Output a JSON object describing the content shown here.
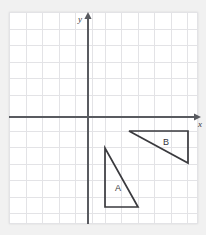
{
  "figure": {
    "kind": "coordinate-grid-geometry-figure",
    "background_color": "#f1f1f1",
    "plot_background_color": "#ffffff",
    "grid_color": "#e3e3e6",
    "axis_color": "#595b60",
    "shape_color": "#3a3a3e",
    "plot_frame": {
      "left": 9,
      "top": 12,
      "width": 189,
      "height": 212
    },
    "grid": {
      "spacing_px": 16.5,
      "show": true,
      "vertical_count": 12,
      "horizontal_count": 13
    },
    "axes": {
      "x_axis": {
        "label": "x",
        "label_x": 198,
        "label_y": 126,
        "y_px": 117,
        "x_start": 9,
        "x_end": 197,
        "arrow": "right"
      },
      "y_axis": {
        "label": "y",
        "label_x": 81,
        "label_y": 22,
        "x_px": 88,
        "y_start": 224,
        "y_end": 15,
        "arrow": "up"
      },
      "origin": {
        "x": 88,
        "y": 117
      }
    },
    "shapes": [
      {
        "name": "triangle-a",
        "label": "A",
        "label_x": 118,
        "label_y": 191,
        "type": "right-triangle",
        "points": "105,148 105,207 138,207",
        "vertices_px": [
          [
            105,
            148
          ],
          [
            105,
            207
          ],
          [
            138,
            207
          ]
        ],
        "vertices_grid": [
          [
            1,
            -2
          ],
          [
            1,
            -5.5
          ],
          [
            3,
            -5.5
          ]
        ]
      },
      {
        "name": "triangle-b",
        "label": "B",
        "label_x": 166,
        "label_y": 145,
        "type": "right-triangle",
        "points": "129,131 188,131 188,163",
        "vertices_px": [
          [
            129,
            131
          ],
          [
            188,
            131
          ],
          [
            188,
            163
          ]
        ],
        "vertices_grid": [
          [
            2.5,
            -0.85
          ],
          [
            6,
            -0.85
          ],
          [
            6,
            -2.8
          ]
        ]
      }
    ]
  }
}
